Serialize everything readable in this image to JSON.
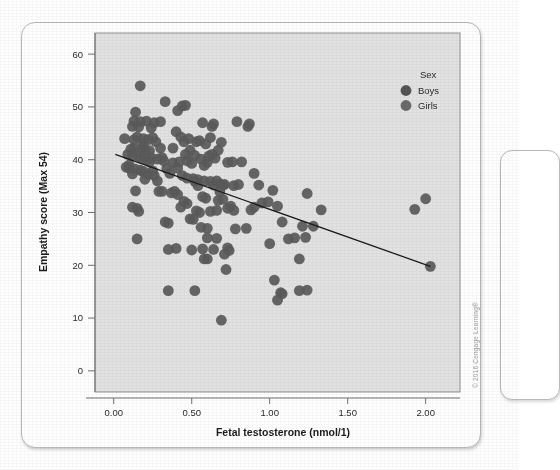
{
  "figure": {
    "copyright": "© 2016 Cengage Learning®",
    "background_color": "#e2e2e2",
    "point_color": "#5a5a5a",
    "line_color": "#1b1b1b",
    "card_color": "#ffffff"
  },
  "legend": {
    "title": "Sex",
    "entries": [
      {
        "label": "Boys",
        "color": "#555555"
      },
      {
        "label": "Girls",
        "color": "#6b6b6b"
      }
    ]
  },
  "chart_data": {
    "type": "scatter",
    "title": "",
    "xlabel": "Fetal testosterone (nmol/1)",
    "ylabel": "Empathy score (Max 54)",
    "xlim": [
      -0.12,
      2.22
    ],
    "ylim": [
      -4,
      64
    ],
    "xticks": [
      0.0,
      0.5,
      1.0,
      1.5,
      2.0
    ],
    "xtick_labels": [
      "0.00",
      "0.50",
      "1.00",
      "1.50",
      "2.00"
    ],
    "yticks": [
      0,
      10,
      20,
      30,
      40,
      50,
      60
    ],
    "ytick_labels": [
      "0",
      "10",
      "20",
      "30",
      "40",
      "50",
      "60"
    ],
    "grid": false,
    "legend_position": "top-right",
    "marker_size": 5.4,
    "trendline": {
      "type": "linear",
      "x": [
        0.01,
        2.03
      ],
      "y": [
        41.0,
        19.8
      ],
      "slope": -10.5,
      "intercept": 41.1
    },
    "series": [
      {
        "name": "Boys and Girls",
        "color": "#5a5a5a",
        "points": [
          [
            0.17,
            54.0
          ],
          [
            0.33,
            51.0
          ],
          [
            0.14,
            49.0
          ],
          [
            0.41,
            49.3
          ],
          [
            0.44,
            50.2
          ],
          [
            0.46,
            50.3
          ],
          [
            0.13,
            47.3
          ],
          [
            0.17,
            47.2
          ],
          [
            0.21,
            47.3
          ],
          [
            0.26,
            47.0
          ],
          [
            0.3,
            47.2
          ],
          [
            0.12,
            46.3
          ],
          [
            0.16,
            46.2
          ],
          [
            0.24,
            46.0
          ],
          [
            0.4,
            45.3
          ],
          [
            0.57,
            47.0
          ],
          [
            0.63,
            46.3
          ],
          [
            0.64,
            46.8
          ],
          [
            0.07,
            44.0
          ],
          [
            0.15,
            44.3
          ],
          [
            0.19,
            44.0
          ],
          [
            0.22,
            43.8
          ],
          [
            0.27,
            43.4
          ],
          [
            0.43,
            44.3
          ],
          [
            0.45,
            43.4
          ],
          [
            0.48,
            44.0
          ],
          [
            0.53,
            43.4
          ],
          [
            0.55,
            43.6
          ],
          [
            0.11,
            42.0
          ],
          [
            0.13,
            42.2
          ],
          [
            0.18,
            42.1
          ],
          [
            0.2,
            41.9
          ],
          [
            0.23,
            41.7
          ],
          [
            0.3,
            42.2
          ],
          [
            0.46,
            41.0
          ],
          [
            0.49,
            41.8
          ],
          [
            0.52,
            40.8
          ],
          [
            0.09,
            41.0
          ],
          [
            0.12,
            40.8
          ],
          [
            0.16,
            40.6
          ],
          [
            0.18,
            40.3
          ],
          [
            0.21,
            40.0
          ],
          [
            0.24,
            40.4
          ],
          [
            0.28,
            40.1
          ],
          [
            0.32,
            39.8
          ],
          [
            0.38,
            39.4
          ],
          [
            0.42,
            39.6
          ],
          [
            0.47,
            39.8
          ],
          [
            0.5,
            39.3
          ],
          [
            0.56,
            40.1
          ],
          [
            0.6,
            39.5
          ],
          [
            0.08,
            38.6
          ],
          [
            0.1,
            38.4
          ],
          [
            0.14,
            38.2
          ],
          [
            0.17,
            38.0
          ],
          [
            0.19,
            37.8
          ],
          [
            0.25,
            37.9
          ],
          [
            0.34,
            38.3
          ],
          [
            0.36,
            37.4
          ],
          [
            0.44,
            37.0
          ],
          [
            0.51,
            36.4
          ],
          [
            0.54,
            36.2
          ],
          [
            0.58,
            36.0
          ],
          [
            0.62,
            35.9
          ],
          [
            0.66,
            36.0
          ],
          [
            0.68,
            35.4
          ],
          [
            0.7,
            35.2
          ],
          [
            0.73,
            39.5
          ],
          [
            0.76,
            39.6
          ],
          [
            0.79,
            47.2
          ],
          [
            0.86,
            46.3
          ],
          [
            0.87,
            46.8
          ],
          [
            0.82,
            39.6
          ],
          [
            0.9,
            37.4
          ],
          [
            0.93,
            35.2
          ],
          [
            0.77,
            35.1
          ],
          [
            0.8,
            35.3
          ],
          [
            0.69,
            43.3
          ],
          [
            0.67,
            41.8
          ],
          [
            0.65,
            40.3
          ],
          [
            0.63,
            41.0
          ],
          [
            0.61,
            40.7
          ],
          [
            0.59,
            32.7
          ],
          [
            0.57,
            33.0
          ],
          [
            0.55,
            30.0
          ],
          [
            0.53,
            30.3
          ],
          [
            0.51,
            28.7
          ],
          [
            0.49,
            28.8
          ],
          [
            0.47,
            31.7
          ],
          [
            0.45,
            32.1
          ],
          [
            0.43,
            31.0
          ],
          [
            0.41,
            33.4
          ],
          [
            0.39,
            34.0
          ],
          [
            0.37,
            33.7
          ],
          [
            0.35,
            28.0
          ],
          [
            0.33,
            28.2
          ],
          [
            0.31,
            34.0
          ],
          [
            0.29,
            34.0
          ],
          [
            0.14,
            34.1
          ],
          [
            0.12,
            31.0
          ],
          [
            0.15,
            30.8
          ],
          [
            0.16,
            30.2
          ],
          [
            0.15,
            25.0
          ],
          [
            0.35,
            23.0
          ],
          [
            0.4,
            23.2
          ],
          [
            0.5,
            22.9
          ],
          [
            0.57,
            23.1
          ],
          [
            0.6,
            21.2
          ],
          [
            0.64,
            23.0
          ],
          [
            0.66,
            25.1
          ],
          [
            0.71,
            22.1
          ],
          [
            0.73,
            23.3
          ],
          [
            0.74,
            22.8
          ],
          [
            0.72,
            19.2
          ],
          [
            0.78,
            26.9
          ],
          [
            0.85,
            27.0
          ],
          [
            0.88,
            30.5
          ],
          [
            0.9,
            31.0
          ],
          [
            0.95,
            31.8
          ],
          [
            0.99,
            32.0
          ],
          [
            1.02,
            34.2
          ],
          [
            1.05,
            31.2
          ],
          [
            1.08,
            28.2
          ],
          [
            1.12,
            25.0
          ],
          [
            1.16,
            25.2
          ],
          [
            1.19,
            21.2
          ],
          [
            1.21,
            27.4
          ],
          [
            1.23,
            25.3
          ],
          [
            1.24,
            33.6
          ],
          [
            1.28,
            27.4
          ],
          [
            1.33,
            30.5
          ],
          [
            1.0,
            24.1
          ],
          [
            1.03,
            17.2
          ],
          [
            1.05,
            13.4
          ],
          [
            1.07,
            14.8
          ],
          [
            1.08,
            14.6
          ],
          [
            1.19,
            15.2
          ],
          [
            1.24,
            15.3
          ],
          [
            0.35,
            15.2
          ],
          [
            0.52,
            15.2
          ],
          [
            0.69,
            9.6
          ],
          [
            0.62,
            30.2
          ],
          [
            0.66,
            30.4
          ],
          [
            0.6,
            27.0
          ],
          [
            0.56,
            27.2
          ],
          [
            0.67,
            32.3
          ],
          [
            0.7,
            32.5
          ],
          [
            0.68,
            34.0
          ],
          [
            0.64,
            35.2
          ],
          [
            0.71,
            35.3
          ],
          [
            0.73,
            30.8
          ],
          [
            0.75,
            31.2
          ],
          [
            0.77,
            30.4
          ],
          [
            0.6,
            25.2
          ],
          [
            0.58,
            21.2
          ],
          [
            1.93,
            30.6
          ],
          [
            2.0,
            32.6
          ],
          [
            2.03,
            19.8
          ],
          [
            0.1,
            39.0
          ],
          [
            0.12,
            37.3
          ],
          [
            0.22,
            37.2
          ],
          [
            0.26,
            37.0
          ],
          [
            0.28,
            36.0
          ],
          [
            0.2,
            36.3
          ],
          [
            0.23,
            39.6
          ],
          [
            0.19,
            43.0
          ],
          [
            0.13,
            43.8
          ],
          [
            0.25,
            44.2
          ],
          [
            0.31,
            40.4
          ],
          [
            0.38,
            42.2
          ],
          [
            0.41,
            38.4
          ],
          [
            0.47,
            36.5
          ],
          [
            0.52,
            35.9
          ],
          [
            0.54,
            35.1
          ],
          [
            0.58,
            38.9
          ],
          [
            0.62,
            44.2
          ],
          [
            0.59,
            43.0
          ]
        ]
      }
    ]
  },
  "axes": {
    "x_title": "Fetal testosterone (nmol/1)",
    "y_title": "Empathy score (Max 54)"
  }
}
